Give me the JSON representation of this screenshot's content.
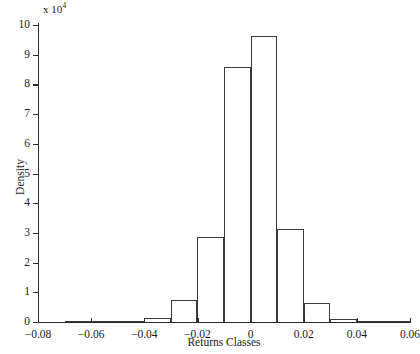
{
  "chart_data": {
    "type": "bar",
    "title": "",
    "xlabel": "Returns Classes",
    "ylabel": "Density",
    "y_multiplier_text": "x 10",
    "y_multiplier_exponent": "4",
    "xlim": [
      -0.08,
      0.06
    ],
    "ylim": [
      0,
      10
    ],
    "grid": false,
    "legend": null,
    "bin_width": 0.01,
    "xticks": [
      -0.08,
      -0.06,
      -0.04,
      -0.02,
      0,
      0.02,
      0.04,
      0.06
    ],
    "xtick_labels": [
      "−0.08",
      "−0.06",
      "−0.04",
      "−0.02",
      "0",
      "0.02",
      "0.04",
      "0.06"
    ],
    "yticks": [
      0,
      1,
      2,
      3,
      4,
      5,
      6,
      7,
      8,
      9,
      10
    ],
    "ytick_labels": [
      "0",
      "1",
      "2",
      "3",
      "4",
      "5",
      "6",
      "7",
      "8",
      "9",
      "10"
    ],
    "bins": [
      {
        "left": -0.08,
        "right": -0.07,
        "value": 0.0
      },
      {
        "left": -0.07,
        "right": -0.06,
        "value": 0.02
      },
      {
        "left": -0.06,
        "right": -0.05,
        "value": 0.02
      },
      {
        "left": -0.05,
        "right": -0.04,
        "value": 0.04
      },
      {
        "left": -0.04,
        "right": -0.03,
        "value": 0.12
      },
      {
        "left": -0.03,
        "right": -0.02,
        "value": 0.73
      },
      {
        "left": -0.02,
        "right": -0.01,
        "value": 2.86
      },
      {
        "left": -0.01,
        "right": 0.0,
        "value": 8.6
      },
      {
        "left": 0.0,
        "right": 0.01,
        "value": 9.62
      },
      {
        "left": 0.01,
        "right": 0.02,
        "value": 3.13
      },
      {
        "left": 0.02,
        "right": 0.03,
        "value": 0.65
      },
      {
        "left": 0.03,
        "right": 0.04,
        "value": 0.1
      },
      {
        "left": 0.04,
        "right": 0.05,
        "value": 0.03
      },
      {
        "left": 0.05,
        "right": 0.06,
        "value": 0.02
      }
    ]
  }
}
